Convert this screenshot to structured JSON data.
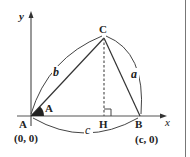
{
  "diagram": {
    "type": "triangle-on-coordinate-axes",
    "axes": {
      "x_label": "x",
      "y_label": "y"
    },
    "vertices": {
      "A": {
        "label": "A",
        "coords": "(0, 0)"
      },
      "B": {
        "label": "B",
        "coords": "(c, 0)"
      },
      "C": {
        "label": "C"
      },
      "H": {
        "label": "H"
      }
    },
    "angle_label": "A",
    "sides": {
      "a": "a",
      "b": "b",
      "c": "c"
    },
    "colors": {
      "stroke": "#333333",
      "axis": "#555555",
      "text": "#222222",
      "fill_angle": "#222222"
    }
  }
}
